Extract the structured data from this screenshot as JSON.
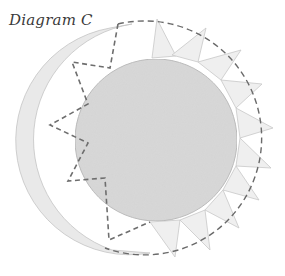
{
  "title": "Diagram C",
  "diagram": {
    "colors": {
      "inner_circle": "#d6d6d6",
      "tabs": "#ececec",
      "dashed_line": "#6a6a6a",
      "outline": "#bdbdbd"
    }
  }
}
